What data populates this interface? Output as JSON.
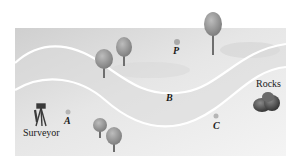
{
  "figure": {
    "colors": {
      "background": "#ffffff",
      "panel_light": "#f2f2f2",
      "panel_dark": "#c9c9c9",
      "river_bank": "#ffffff",
      "tree_foliage": "#8c8c8c",
      "tree_trunk": "#6e6e6e",
      "rocks": "#4a4a4a",
      "point_marker": "#a9a9a9",
      "label": "#1a1a1a"
    }
  },
  "labels": {
    "surveyor": "Surveyor",
    "rocks": "Rocks",
    "point_a": "A",
    "point_b": "B",
    "point_c": "C",
    "point_p": "P"
  },
  "icons": {
    "surveyor": "surveyor-tripod-icon",
    "rocks": "rocks-icon",
    "tree": "tree-icon"
  }
}
